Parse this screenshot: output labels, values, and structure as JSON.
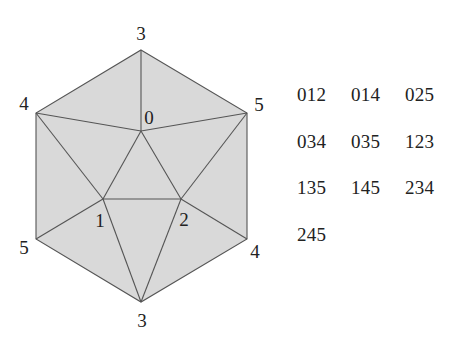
{
  "diagram": {
    "title": "",
    "fill_color": "#d9d9d9",
    "edge_color": "#555555",
    "vertices": [
      {
        "id": "top",
        "label": "3",
        "x": 141,
        "y": 50,
        "lx": 141,
        "ly": 40
      },
      {
        "id": "ul",
        "label": "4",
        "x": 36,
        "y": 113,
        "lx": 24,
        "ly": 110
      },
      {
        "id": "ur",
        "label": "5",
        "x": 247,
        "y": 113,
        "lx": 259,
        "ly": 111
      },
      {
        "id": "ll",
        "label": "5",
        "x": 36,
        "y": 239,
        "lx": 24,
        "ly": 254
      },
      {
        "id": "lr",
        "label": "4",
        "x": 247,
        "y": 239,
        "lx": 255,
        "ly": 258
      },
      {
        "id": "bottom",
        "label": "3",
        "x": 141,
        "y": 302,
        "lx": 142,
        "ly": 327
      },
      {
        "id": "v0",
        "label": "0",
        "x": 141,
        "y": 131,
        "lx": 149,
        "ly": 124
      },
      {
        "id": "v1",
        "label": "1",
        "x": 103,
        "y": 199,
        "lx": 100,
        "ly": 227
      },
      {
        "id": "v2",
        "label": "2",
        "x": 181,
        "y": 199,
        "lx": 184,
        "ly": 226
      }
    ],
    "vertex_labels": {
      "top": "3",
      "upper_left": "4",
      "upper_right": "5",
      "lower_left": "5",
      "lower_right": "4",
      "bottom": "3",
      "center_top": "0",
      "center_left": "1",
      "center_right": "2"
    },
    "edges": [
      [
        "top",
        "ul"
      ],
      [
        "top",
        "ur"
      ],
      [
        "top",
        "v0"
      ],
      [
        "ul",
        "ll"
      ],
      [
        "ur",
        "lr"
      ],
      [
        "ll",
        "bottom"
      ],
      [
        "lr",
        "bottom"
      ],
      [
        "ul",
        "v0"
      ],
      [
        "ur",
        "v0"
      ],
      [
        "ul",
        "v1"
      ],
      [
        "ur",
        "v2"
      ],
      [
        "v0",
        "v1"
      ],
      [
        "v0",
        "v2"
      ],
      [
        "v1",
        "v2"
      ],
      [
        "ll",
        "v1"
      ],
      [
        "lr",
        "v2"
      ],
      [
        "v1",
        "bottom"
      ],
      [
        "v2",
        "bottom"
      ]
    ]
  },
  "triples": [
    "012",
    "014",
    "025",
    "034",
    "035",
    "123",
    "135",
    "145",
    "234",
    "245"
  ]
}
